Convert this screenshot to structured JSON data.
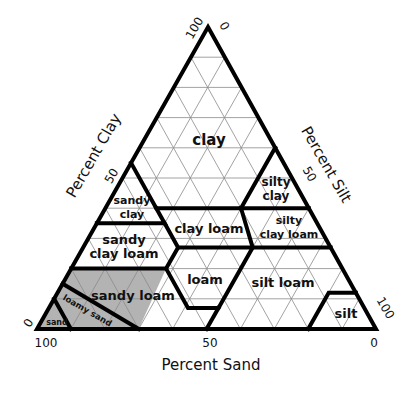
{
  "diagram": {
    "type": "soil-texture-triangle",
    "axes": {
      "clay": {
        "title": "Percent Clay",
        "ticks": [
          "0",
          "50",
          "100"
        ]
      },
      "silt": {
        "title": "Percent Silt",
        "ticks": [
          "0",
          "50",
          "100"
        ]
      },
      "sand": {
        "title": "Percent Sand",
        "ticks": [
          "100",
          "50",
          "0"
        ]
      }
    },
    "grid_step_percent": 10,
    "regions": [
      {
        "id": "clay",
        "label": "clay"
      },
      {
        "id": "sandy-clay",
        "label_lines": [
          "sandy",
          "clay"
        ]
      },
      {
        "id": "silty-clay",
        "label_lines": [
          "silty",
          "clay"
        ]
      },
      {
        "id": "clay-loam",
        "label": "clay loam"
      },
      {
        "id": "silty-clay-loam",
        "label_lines": [
          "silty",
          "clay loam"
        ]
      },
      {
        "id": "sandy-clay-loam",
        "label_lines": [
          "sandy",
          "clay loam"
        ]
      },
      {
        "id": "loam",
        "label": "loam"
      },
      {
        "id": "silt-loam",
        "label": "silt loam"
      },
      {
        "id": "sandy-loam",
        "label": "sandy loam",
        "shaded": true
      },
      {
        "id": "loamy-sand",
        "label": "loamy sand",
        "shaded": true
      },
      {
        "id": "sand",
        "label": "sand",
        "shaded": true
      },
      {
        "id": "silt",
        "label": "silt"
      }
    ],
    "colors": {
      "shade": "#b3b3b3",
      "boundary": "#000000",
      "grid": "#8a8a8a"
    }
  }
}
